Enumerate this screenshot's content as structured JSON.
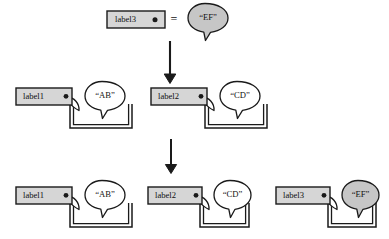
{
  "figure": {
    "background_color": "#ffffff",
    "stroke_color": "#1a1a1a",
    "box_fill": "#d6d6d6",
    "bubble_fill_plain": "#ffffff",
    "bubble_fill_highlight": "#c6c6c6",
    "equals_symbol": "="
  },
  "top_row": {
    "definition_box": {
      "label": "label3",
      "port": "port-dot"
    },
    "equals": "=",
    "definition_bubble": {
      "text": "“EF”",
      "highlighted": true
    }
  },
  "arrows": [
    {
      "name": "arrow-top-to-middle",
      "direction": "down"
    },
    {
      "name": "arrow-middle-to-bottom",
      "direction": "down"
    }
  ],
  "middle_row": {
    "groups": [
      {
        "label": "label1",
        "bubble": "“AB”",
        "highlighted": false
      },
      {
        "label": "label2",
        "bubble": "“CD”",
        "highlighted": false
      }
    ]
  },
  "bottom_row": {
    "groups": [
      {
        "label": "label1",
        "bubble": "“AB”",
        "highlighted": false
      },
      {
        "label": "label2",
        "bubble": "“CD”",
        "highlighted": false
      },
      {
        "label": "label3",
        "bubble": "“EF”",
        "highlighted": true
      }
    ]
  }
}
